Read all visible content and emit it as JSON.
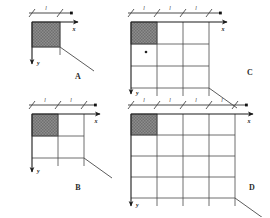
{
  "figure": {
    "title": "",
    "background": "#ffffff",
    "width": 270,
    "height": 217,
    "line_color": "#4a4a4a",
    "axis_color": "#1a1a1a",
    "hatch_fill": "#8a8a8a",
    "hatch_stroke": "#555555"
  },
  "panels": [
    {
      "id": "A",
      "label": "A",
      "label_pos": {
        "x": 78,
        "y": 79
      },
      "origin": {
        "x": 32,
        "y": 22
      },
      "cell": {
        "w": 28,
        "h": 25
      },
      "cols": 1,
      "rows": 1,
      "shaded_cell": {
        "col": 0,
        "row": 0
      },
      "tick_count": 1,
      "dim_labels": [
        "l"
      ],
      "x_axis_label": "x",
      "y_axis_label": "y",
      "x_axis_len": 46,
      "y_axis_len": 42,
      "diagonal": {
        "dx": 34,
        "dy": 24
      },
      "node_labels": []
    },
    {
      "id": "B",
      "label": "B",
      "label_pos": {
        "x": 78,
        "y": 190
      },
      "origin": {
        "x": 32,
        "y": 114
      },
      "cell": {
        "w": 26,
        "h": 22
      },
      "cols": 2,
      "rows": 2,
      "shaded_cell": {
        "col": 0,
        "row": 0
      },
      "tick_count": 2,
      "dim_labels": [
        "l",
        "l"
      ],
      "x_axis_label": "x",
      "y_axis_label": "y",
      "x_axis_len": 68,
      "y_axis_len": 58,
      "diagonal": {
        "dx": 28,
        "dy": 20
      },
      "node_labels": []
    },
    {
      "id": "C",
      "label": "C",
      "label_pos": {
        "x": 250,
        "y": 75
      },
      "origin": {
        "x": 131,
        "y": 22
      },
      "cell": {
        "w": 26,
        "h": 22
      },
      "cols": 3,
      "rows": 3,
      "shaded_cell": {
        "col": 0,
        "row": 0
      },
      "tick_count": 3,
      "dim_labels": [
        "l",
        "l",
        "l"
      ],
      "x_axis_label": "x",
      "y_axis_label": "y",
      "x_axis_len": 96,
      "y_axis_len": 72,
      "diagonal": {
        "dx": 28,
        "dy": 20
      },
      "node_labels": [
        {
          "text": "•",
          "x": 146,
          "y": 52
        }
      ]
    },
    {
      "id": "D",
      "label": "D",
      "label_pos": {
        "x": 252,
        "y": 190
      },
      "origin": {
        "x": 131,
        "y": 114
      },
      "cell": {
        "w": 26,
        "h": 21
      },
      "cols": 4,
      "rows": 4,
      "shaded_cell": {
        "col": 0,
        "row": 0
      },
      "tick_count": 4,
      "dim_labels": [
        "l",
        "l",
        "l",
        "l"
      ],
      "x_axis_label": "x",
      "y_axis_label": "y",
      "x_axis_len": 122,
      "y_axis_len": 92,
      "diagonal": {
        "dx": 28,
        "dy": 20
      },
      "node_labels": []
    }
  ]
}
